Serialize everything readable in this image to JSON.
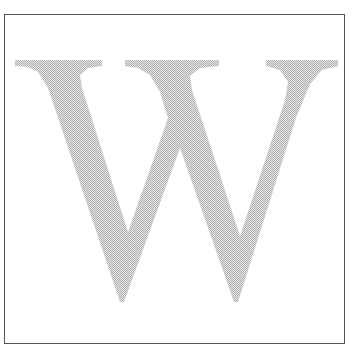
{
  "image": {
    "letter": "W",
    "fill_color": "#c8c8c8",
    "border_color": "#555555",
    "background": "#ffffff"
  }
}
